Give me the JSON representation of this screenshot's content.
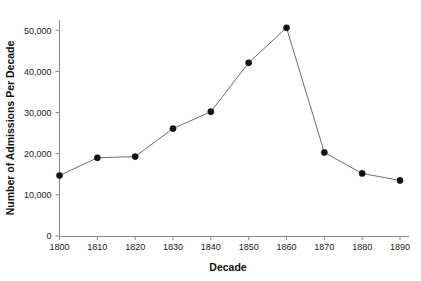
{
  "chart_data": {
    "type": "line",
    "title": "",
    "xlabel": "Decade",
    "ylabel": "Number of Admissions Per Decade",
    "categories": [
      "1800",
      "1810",
      "1820",
      "1830",
      "1840",
      "1850",
      "1860",
      "1870",
      "1880",
      "1890"
    ],
    "x": [
      1800,
      1810,
      1820,
      1830,
      1840,
      1850,
      1860,
      1870,
      1880,
      1890
    ],
    "values": [
      14700,
      19000,
      19300,
      26100,
      30200,
      42100,
      50600,
      20300,
      15200,
      13500
    ],
    "series": [
      {
        "name": "Admissions",
        "values": [
          14700,
          19000,
          19300,
          26100,
          30200,
          42100,
          50600,
          20300,
          15200,
          13500
        ]
      }
    ],
    "xlim": [
      1800,
      1890
    ],
    "ylim": [
      0,
      52000
    ],
    "yticks": [
      0,
      10000,
      20000,
      30000,
      40000,
      50000
    ],
    "ytick_labels": [
      "0",
      "10,000",
      "20,000",
      "30,000",
      "40,000",
      "50,000"
    ],
    "xticks": [
      1800,
      1810,
      1820,
      1830,
      1840,
      1850,
      1860,
      1870,
      1880,
      1890
    ],
    "xtick_labels": [
      "1800",
      "1810",
      "1820",
      "1830",
      "1840",
      "1850",
      "1860",
      "1870",
      "1880",
      "1890"
    ],
    "grid": false,
    "legend": false,
    "legend_position": "none",
    "marker": "filled-circle",
    "line_color": "#5c5c5c",
    "marker_color": "#111111",
    "axis_color": "#8a8a8a",
    "background_color": "#ffffff"
  }
}
